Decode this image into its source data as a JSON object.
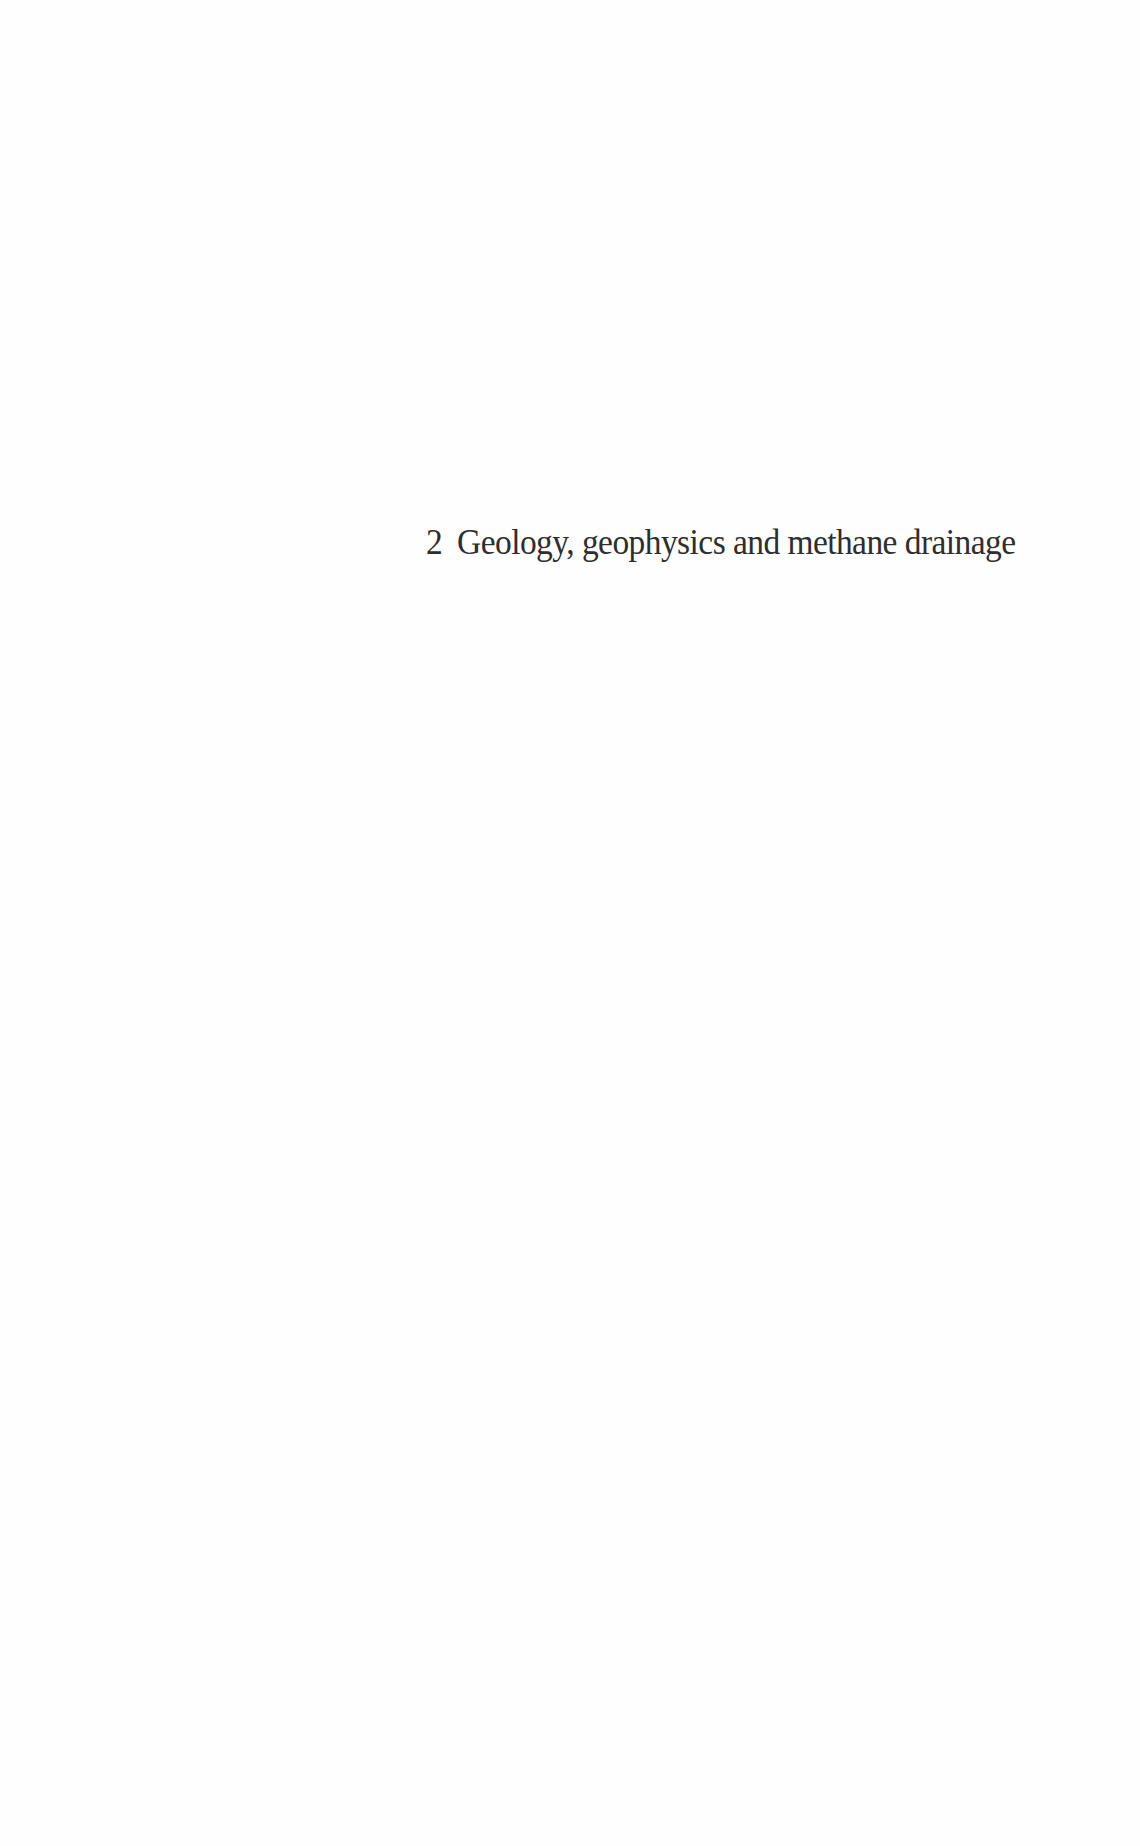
{
  "chapter": {
    "number": "2",
    "title": "Geology, geophysics and methane drainage"
  },
  "colors": {
    "background": "#fefefe",
    "text": "#2e2e2e"
  }
}
